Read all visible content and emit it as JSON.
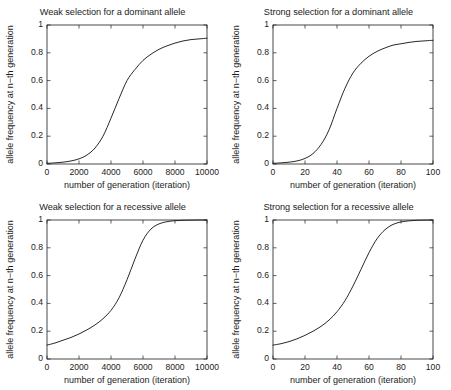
{
  "figure": {
    "width": 451,
    "height": 390,
    "background": "#ffffff",
    "line_color": "#1c1c1c",
    "layout": "2x2 grid of line plots"
  },
  "chart_data": [
    {
      "id": "weak-dominant",
      "type": "line",
      "title": "Weak selection for a dominant allele",
      "xlabel": "number of generation (iteration)",
      "ylabel": "allele frequency at n−th generation",
      "xlim": [
        0,
        10000
      ],
      "ylim": [
        0,
        1
      ],
      "xticks": [
        0,
        2000,
        4000,
        6000,
        8000,
        10000
      ],
      "xtick_labels": [
        "0",
        "2000",
        "4000",
        "6000",
        "8000",
        "10000"
      ],
      "yticks": [
        0,
        0.2,
        0.4,
        0.6,
        0.8,
        1
      ],
      "ytick_labels": [
        "0",
        "0.2",
        "0.4",
        "0.6",
        "0.8",
        "1"
      ],
      "grid": false,
      "legend": "none",
      "series": [
        {
          "name": "allele frequency",
          "x": [
            0,
            500,
            1000,
            1500,
            2000,
            2500,
            3000,
            3500,
            4000,
            4500,
            5000,
            5500,
            6000,
            6500,
            7000,
            7500,
            8000,
            8500,
            9000,
            9500,
            10000
          ],
          "values": [
            0.005,
            0.008,
            0.013,
            0.022,
            0.037,
            0.065,
            0.115,
            0.2,
            0.33,
            0.47,
            0.6,
            0.68,
            0.745,
            0.79,
            0.825,
            0.85,
            0.87,
            0.885,
            0.895,
            0.9,
            0.905
          ]
        }
      ]
    },
    {
      "id": "strong-dominant",
      "type": "line",
      "title": "Strong selection for a dominant allele",
      "xlabel": "number of generation (iteration)",
      "ylabel": "allele frequency at n−th generation",
      "xlim": [
        0,
        100
      ],
      "ylim": [
        0,
        1
      ],
      "xticks": [
        0,
        20,
        40,
        60,
        80,
        100
      ],
      "xtick_labels": [
        "0",
        "20",
        "40",
        "60",
        "80",
        "100"
      ],
      "yticks": [
        0,
        0.2,
        0.4,
        0.6,
        0.8,
        1
      ],
      "ytick_labels": [
        "0",
        "0.2",
        "0.4",
        "0.6",
        "0.8",
        "1"
      ],
      "grid": false,
      "legend": "none",
      "series": [
        {
          "name": "allele frequency",
          "x": [
            0,
            5,
            10,
            15,
            20,
            25,
            30,
            35,
            40,
            45,
            50,
            55,
            60,
            65,
            70,
            75,
            80,
            85,
            90,
            95,
            100
          ],
          "values": [
            0.005,
            0.008,
            0.013,
            0.022,
            0.04,
            0.075,
            0.14,
            0.245,
            0.4,
            0.545,
            0.655,
            0.725,
            0.775,
            0.81,
            0.835,
            0.855,
            0.865,
            0.875,
            0.882,
            0.886,
            0.89
          ]
        }
      ]
    },
    {
      "id": "weak-recessive",
      "type": "line",
      "title": "Weak selection for a recessive allele",
      "xlabel": "number of generation (iteration)",
      "ylabel": "allele frequency at n−th generation",
      "xlim": [
        0,
        10000
      ],
      "ylim": [
        0,
        1
      ],
      "xticks": [
        0,
        2000,
        4000,
        6000,
        8000,
        10000
      ],
      "xtick_labels": [
        "0",
        "2000",
        "4000",
        "6000",
        "8000",
        "10000"
      ],
      "yticks": [
        0,
        0.2,
        0.4,
        0.6,
        0.8,
        1
      ],
      "ytick_labels": [
        "0",
        "0.2",
        "0.4",
        "0.6",
        "0.8",
        "1"
      ],
      "grid": false,
      "legend": "none",
      "series": [
        {
          "name": "allele frequency",
          "x": [
            0,
            500,
            1000,
            1500,
            2000,
            2500,
            3000,
            3500,
            4000,
            4500,
            5000,
            5500,
            6000,
            6500,
            7000,
            7500,
            8000,
            8500,
            9000,
            9500,
            10000
          ],
          "values": [
            0.1,
            0.115,
            0.135,
            0.155,
            0.18,
            0.21,
            0.245,
            0.29,
            0.35,
            0.44,
            0.57,
            0.72,
            0.855,
            0.935,
            0.972,
            0.988,
            0.995,
            0.998,
            0.999,
            1.0,
            1.0
          ]
        }
      ]
    },
    {
      "id": "strong-recessive",
      "type": "line",
      "title": "Strong selection for a recessive allele",
      "xlabel": "number of generation (iteration)",
      "ylabel": "allele frequency at n−th generation",
      "xlim": [
        0,
        100
      ],
      "ylim": [
        0,
        1
      ],
      "xticks": [
        0,
        20,
        40,
        60,
        80,
        100
      ],
      "xtick_labels": [
        "0",
        "20",
        "40",
        "60",
        "80",
        "100"
      ],
      "yticks": [
        0,
        0.2,
        0.4,
        0.6,
        0.8,
        1
      ],
      "ytick_labels": [
        "0",
        "0.2",
        "0.4",
        "0.6",
        "0.8",
        "1"
      ],
      "grid": false,
      "legend": "none",
      "series": [
        {
          "name": "allele frequency",
          "x": [
            0,
            5,
            10,
            15,
            20,
            25,
            30,
            35,
            40,
            45,
            50,
            55,
            60,
            65,
            70,
            75,
            80,
            85,
            90,
            95,
            100
          ],
          "values": [
            0.1,
            0.11,
            0.125,
            0.145,
            0.17,
            0.2,
            0.235,
            0.28,
            0.34,
            0.42,
            0.525,
            0.645,
            0.765,
            0.865,
            0.93,
            0.968,
            0.986,
            0.994,
            0.998,
            0.999,
            1.0
          ]
        }
      ]
    }
  ]
}
